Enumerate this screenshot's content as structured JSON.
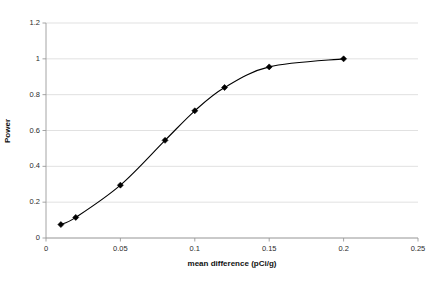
{
  "chart_data": {
    "type": "line",
    "title": "",
    "xlabel": "mean difference (pCi/g)",
    "ylabel": "Power",
    "xlim": [
      0,
      0.25
    ],
    "ylim": [
      0,
      1.2
    ],
    "grid": true,
    "grid_axis": "y",
    "legend": "none",
    "marker": "diamond",
    "line_color": "#000000",
    "marker_color": "#000000",
    "grid_color": "#d9d9d9",
    "axis_color": "#9a9a9a",
    "xticks": [
      0,
      0.05,
      0.1,
      0.15,
      0.2,
      0.25
    ],
    "xtick_labels": [
      "0",
      "0.05",
      "0.1",
      "0.15",
      "0.2",
      "0.25"
    ],
    "yticks": [
      0,
      0.2,
      0.4,
      0.6,
      0.8,
      1,
      1.2
    ],
    "ytick_labels": [
      "0",
      "0.2",
      "0.4",
      "0.6",
      "0.8",
      "1",
      "1.2"
    ],
    "x": [
      0.01,
      0.02,
      0.05,
      0.08,
      0.1,
      0.12,
      0.15,
      0.2
    ],
    "values": [
      0.075,
      0.115,
      0.295,
      0.545,
      0.71,
      0.84,
      0.955,
      1.0
    ],
    "series": [
      {
        "name": "Power",
        "x": [
          0.01,
          0.02,
          0.05,
          0.08,
          0.1,
          0.12,
          0.15,
          0.2
        ],
        "values": [
          0.075,
          0.115,
          0.295,
          0.545,
          0.71,
          0.84,
          0.955,
          1.0
        ]
      }
    ]
  }
}
